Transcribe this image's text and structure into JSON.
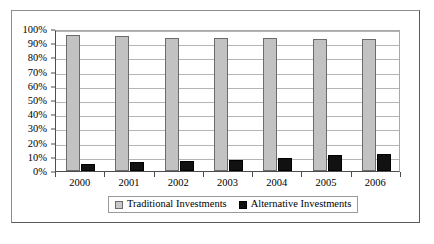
{
  "chart_data": {
    "type": "bar",
    "title": "",
    "subtitle": "",
    "xlabel": "",
    "ylabel": "",
    "categories": [
      "2000",
      "2001",
      "2002",
      "2003",
      "2004",
      "2005",
      "2006"
    ],
    "series": [
      {
        "name": "Traditional Investments",
        "color": "#c2c2c2",
        "values": [
          96,
          95,
          94,
          94,
          94,
          93,
          93
        ]
      },
      {
        "name": "Alternative Investments",
        "color": "#111111",
        "values": [
          5,
          6,
          7,
          8,
          9,
          11,
          12
        ]
      }
    ],
    "ylim": [
      0,
      100
    ],
    "ytick_values": [
      0,
      10,
      20,
      30,
      40,
      50,
      60,
      70,
      80,
      90,
      100
    ],
    "ytick_labels": [
      "0%",
      "10%",
      "20%",
      "30%",
      "40%",
      "50%",
      "60%",
      "70%",
      "80%",
      "90%",
      "100%"
    ],
    "value_suffix": "%",
    "grid": true,
    "grid_axis": "y",
    "legend_position": "bottom-center",
    "frame": true
  }
}
